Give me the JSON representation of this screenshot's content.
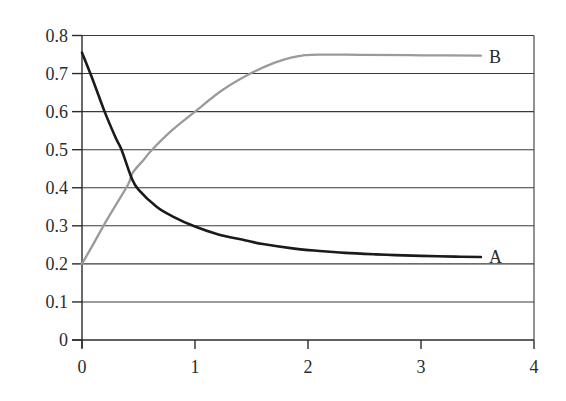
{
  "chart_data": {
    "type": "line",
    "title": "",
    "xlabel": "",
    "ylabel": "",
    "xlim": [
      0,
      4
    ],
    "ylim": [
      0,
      0.8
    ],
    "x_ticks": [
      0,
      1,
      2,
      3,
      4
    ],
    "x_tick_labels": [
      "0",
      "1",
      "2",
      "3",
      "4"
    ],
    "y_ticks": [
      0,
      0.1,
      0.2,
      0.3,
      0.4,
      0.5,
      0.6,
      0.7,
      0.8
    ],
    "y_tick_labels": [
      "0",
      "0.1",
      "0.2",
      "0.3",
      "0.4",
      "0.5",
      "0.6",
      "0.7",
      "0.8"
    ],
    "grid": {
      "horizontal": true,
      "vertical": false
    },
    "legend": "inline labels at line ends",
    "series": [
      {
        "name": "A",
        "color": "#1a1a1a",
        "x": [
          0,
          0.1,
          0.2,
          0.3,
          0.35,
          0.44,
          0.5,
          0.66,
          0.8,
          1.0,
          1.2,
          1.44,
          1.6,
          1.88,
          2.1,
          2.33,
          2.6,
          2.77,
          3.0,
          3.3,
          3.53
        ],
        "y": [
          0.755,
          0.68,
          0.6,
          0.53,
          0.5,
          0.425,
          0.395,
          0.35,
          0.325,
          0.298,
          0.278,
          0.262,
          0.252,
          0.24,
          0.234,
          0.229,
          0.225,
          0.223,
          0.221,
          0.219,
          0.218
        ]
      },
      {
        "name": "B",
        "color": "#9a9a9a",
        "x": [
          0,
          0.1,
          0.19,
          0.3,
          0.41,
          0.45,
          0.55,
          0.62,
          0.8,
          1.0,
          1.24,
          1.49,
          1.7,
          1.85,
          1.96,
          2.1,
          2.5,
          3.0,
          3.53
        ],
        "y": [
          0.2,
          0.252,
          0.3,
          0.355,
          0.41,
          0.44,
          0.475,
          0.5,
          0.552,
          0.6,
          0.656,
          0.7,
          0.728,
          0.742,
          0.748,
          0.75,
          0.749,
          0.748,
          0.747
        ]
      }
    ]
  },
  "labels": {
    "series_a": "A",
    "series_b": "B"
  }
}
